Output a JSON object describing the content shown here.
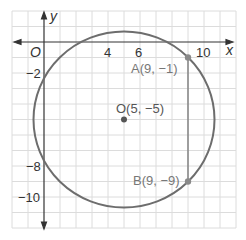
{
  "diagram": {
    "type": "coordinate-plane-circle",
    "axes": {
      "x_label": "x",
      "y_label": "y",
      "origin_label": "O",
      "x_ticks": [
        "4",
        "6",
        "10"
      ],
      "y_ticks": [
        "−2",
        "−8",
        "−10"
      ]
    },
    "circle": {
      "center": {
        "label": "O(5, −5)",
        "x": 5,
        "y": -5
      },
      "color": "#6d6d6d"
    },
    "points": [
      {
        "label": "A(9, −1)",
        "x": 9,
        "y": -1
      },
      {
        "label": "B(9, −9)",
        "x": 9,
        "y": -9
      }
    ],
    "segment": {
      "from": "A",
      "to": "B",
      "color": "#8a8a8a"
    },
    "colors": {
      "grid": "#dcdcdc",
      "axis": "#333333",
      "point": "#8a8a8a",
      "center_point": "#555555"
    }
  }
}
